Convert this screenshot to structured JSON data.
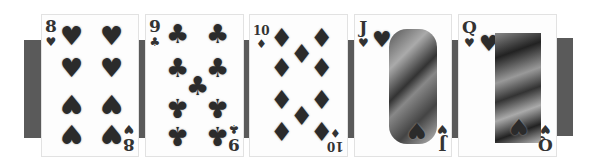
{
  "image": {
    "description": "Five playing cards in a row forming a straight, grayscale",
    "cards": [
      {
        "rank": "8",
        "suit": "hearts",
        "suit_glyph": "♥",
        "pip_count": 8
      },
      {
        "rank": "9",
        "suit": "clubs",
        "suit_glyph": "♣",
        "pip_count": 9
      },
      {
        "rank": "10",
        "suit": "diamonds",
        "suit_glyph": "♦",
        "pip_count": 10
      },
      {
        "rank": "J",
        "suit": "hearts",
        "suit_glyph": "♥",
        "face": "jack"
      },
      {
        "rank": "Q",
        "suit": "hearts",
        "suit_glyph": "♥",
        "face": "queen"
      }
    ],
    "colors": {
      "bar": "#5a5a5a",
      "card": "#fdfdfd",
      "pip": "#2b2b2b"
    }
  }
}
